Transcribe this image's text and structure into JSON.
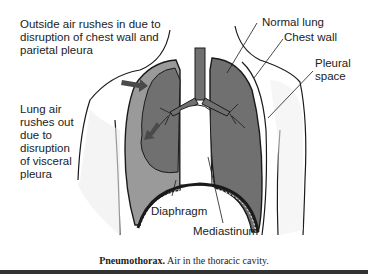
{
  "figure": {
    "title": "Pneumothorax",
    "labels": {
      "outside_air": [
        "Outside air rushes in due to",
        "disruption of chest wall and",
        "parietal pleura"
      ],
      "lung_air": [
        "Lung air",
        "rushes out",
        "due to",
        "disruption",
        "of visceral",
        "pleura"
      ],
      "normal_lung": "Normal lung",
      "chest_wall": "Chest wall",
      "pleural_space": [
        "Pleural",
        "space"
      ],
      "diaphragm": "Diaphragm",
      "mediastinum": "Mediastinum"
    },
    "caption": {
      "bold": "Pneumothorax.",
      "text": " Air in the thoracic cavity."
    },
    "colors": {
      "lung_fill": "#6e6e6e",
      "pleural_space_fill": "#9a9a9a",
      "outline": "#1a1a1a",
      "skin_shade": "#e6e6e6",
      "arrow": "#4a4a4a"
    }
  }
}
